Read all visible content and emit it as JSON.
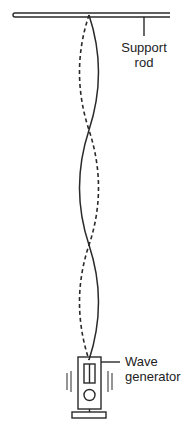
{
  "diagram": {
    "type": "standing-wave-apparatus",
    "labels": {
      "support_rod_line1": "Support",
      "support_rod_line2": "rod",
      "wave_generator_line1": "Wave",
      "wave_generator_line2": "generator"
    },
    "colors": {
      "stroke": "#2a2a2a",
      "background": "#ffffff"
    },
    "string": {
      "nodes": 4,
      "antinodes": 3,
      "solid_and_dashed_envelopes": true
    }
  }
}
